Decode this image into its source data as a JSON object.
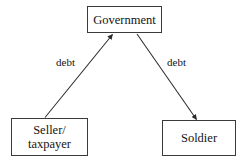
{
  "diagram": {
    "type": "flowchart",
    "nodes": [
      {
        "id": "government",
        "label": "Government",
        "shape": "rectangle"
      },
      {
        "id": "seller_taxpayer",
        "label": "Seller/\ntaxpayer",
        "shape": "rectangle"
      },
      {
        "id": "soldier",
        "label": "Soldier",
        "shape": "rectangle"
      }
    ],
    "edges": [
      {
        "id": "seller-to-government",
        "from": "seller_taxpayer",
        "to": "government",
        "label": "debt",
        "arrow": "single"
      },
      {
        "id": "government-to-soldier",
        "from": "government",
        "to": "soldier",
        "label": "debt",
        "arrow": "single"
      }
    ],
    "colors": {
      "border": "#3a3a3a",
      "text": "#141414",
      "background": "#ffffff",
      "edge": "#2b2b2b"
    }
  }
}
